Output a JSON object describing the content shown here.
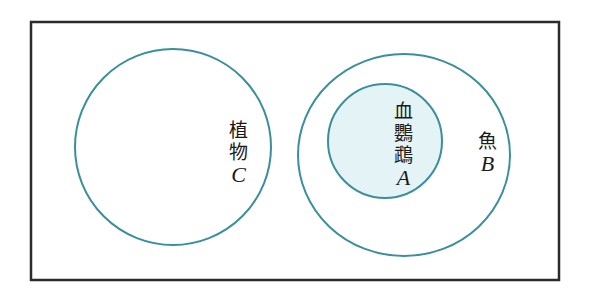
{
  "diagram": {
    "type": "venn",
    "colors": {
      "frame": "#2b2b2b",
      "circle_stroke": "#3a8f9a",
      "inner_fill": "#e3f3f6",
      "background": "#ffffff"
    },
    "sets": {
      "C": {
        "name": "植物",
        "letter": "C"
      },
      "B": {
        "name": "魚",
        "letter": "B"
      },
      "A": {
        "name_line1": "血",
        "name_line2": "鸚",
        "name_line3": "鵡",
        "letter": "A"
      }
    },
    "relations": [
      "A ⊂ B",
      "B ∩ C = ∅"
    ]
  }
}
